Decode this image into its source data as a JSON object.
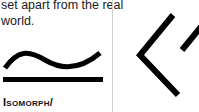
{
  "card_left": {
    "description": "set apart from the real world.",
    "description_lines": [
      "set apart from the real",
      "world."
    ],
    "icon": "isomorphic-symbol-icon",
    "term": "Isomorph/"
  },
  "card_right": {
    "icon": "code-brackets-icon"
  },
  "colors": {
    "background": "#ffffff",
    "text": "#111111",
    "divider": "#cfcfcf"
  }
}
